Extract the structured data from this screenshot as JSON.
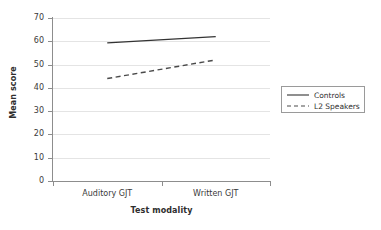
{
  "chart_data": {
    "type": "line",
    "title": "",
    "xlabel": "Test modality",
    "ylabel": "Mean score",
    "categories": [
      "Auditory GJT",
      "Written GJT"
    ],
    "yticks": [
      0,
      10,
      20,
      30,
      40,
      50,
      60,
      70
    ],
    "ylim": [
      0,
      70
    ],
    "grid": true,
    "legend_position": "right",
    "series": [
      {
        "name": "Controls",
        "style": "solid",
        "color": "#333333",
        "values": [
          59.3,
          62.0
        ]
      },
      {
        "name": "L2 Speakers",
        "style": "dashed",
        "color": "#4a4a4a",
        "values": [
          44.0,
          52.0
        ]
      }
    ]
  },
  "legend": {
    "items": [
      {
        "label": "Controls",
        "style": "solid"
      },
      {
        "label": "L2 Speakers",
        "style": "dashed"
      }
    ]
  }
}
